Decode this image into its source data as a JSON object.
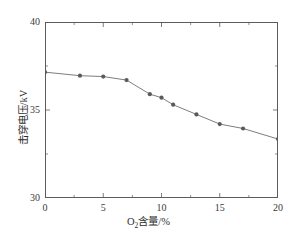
{
  "chart_data": {
    "type": "line",
    "title": "",
    "xlabel": "O2含量/%",
    "xlabel_parts": {
      "pre": "O",
      "sub": "2",
      "post": "含量/%"
    },
    "ylabel": "击穿电压/kV",
    "xlim": [
      0,
      20
    ],
    "ylim": [
      30,
      40
    ],
    "xticks": [
      0,
      5,
      10,
      15,
      20
    ],
    "xtick_labels": [
      "0",
      "5",
      "10",
      "15",
      "20"
    ],
    "yticks": [
      30,
      35,
      40
    ],
    "ytick_labels": [
      "30",
      "35",
      "40"
    ],
    "x_minor_ticks": [
      2.5,
      7.5,
      12.5,
      17.5
    ],
    "y_minor_ticks": [
      32.5,
      37.5
    ],
    "grid": false,
    "legend": false,
    "series": [
      {
        "name": "击穿电压",
        "marker": "circle",
        "color": "#5a5a5a",
        "line_color": "#6e6e6e",
        "x": [
          0,
          3,
          5,
          7,
          9,
          10,
          11,
          13,
          15,
          17,
          20
        ],
        "values": [
          37.15,
          36.95,
          36.9,
          36.7,
          35.9,
          35.7,
          35.3,
          34.75,
          34.2,
          33.95,
          33.35
        ]
      }
    ]
  }
}
